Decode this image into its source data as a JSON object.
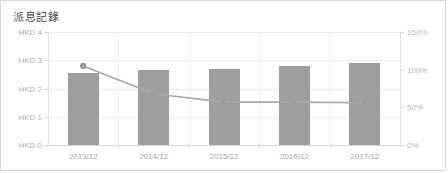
{
  "card": {
    "title": "派息記錄",
    "border_color": "#d9d9d9",
    "background": "#ffffff"
  },
  "chart_data": {
    "type": "bar",
    "title": "派息記錄",
    "xlabel": "",
    "ylabel": "HKD",
    "categories": [
      "2013/12",
      "2014/12",
      "2015/12",
      "2016/12",
      "2017/12"
    ],
    "series": [
      {
        "name": "派息 (HKD)",
        "type": "bar",
        "axis": "left",
        "color": "#9e9e9e",
        "values": [
          2.55,
          2.65,
          2.7,
          2.8,
          2.9
        ]
      },
      {
        "name": "派息比率 (%)",
        "type": "line",
        "axis": "right",
        "color": "#a8a8a8",
        "marker_color": "#9a9a9a",
        "values": [
          105,
          68,
          57,
          57,
          56
        ]
      }
    ],
    "ylim": [
      0,
      4
    ],
    "yticks": [
      0,
      1,
      2,
      3,
      4
    ],
    "ytick_labels": [
      "HKD 0",
      "HKD 1",
      "HKD 2",
      "HKD 3",
      "HKD 4"
    ],
    "y2lim": [
      0,
      150
    ],
    "y2ticks": [
      0,
      50,
      100,
      150
    ],
    "y2tick_labels": [
      "0%",
      "50%",
      "100%",
      "150%"
    ],
    "grid": true,
    "legend": "none",
    "axis_label_color": "#b0b0b0",
    "axis2_label_color": "#c2b4b4",
    "gridline_color": "#ececec"
  }
}
